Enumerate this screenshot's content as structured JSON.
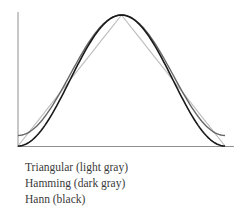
{
  "chart_data": {
    "type": "line",
    "title": "",
    "xlabel": "",
    "ylabel": "",
    "x_range": [
      0,
      1
    ],
    "y_range": [
      0,
      1
    ],
    "grid": false,
    "legend_position": "below",
    "x": [
      0,
      0.05,
      0.1,
      0.15,
      0.2,
      0.25,
      0.3,
      0.35,
      0.4,
      0.45,
      0.5,
      0.55,
      0.6,
      0.65,
      0.7,
      0.75,
      0.8,
      0.85,
      0.9,
      0.95,
      1.0
    ],
    "series": [
      {
        "name": "Triangular",
        "color": "#c0c0c0",
        "values": [
          0,
          0.1,
          0.2,
          0.3,
          0.4,
          0.5,
          0.6,
          0.7,
          0.8,
          0.9,
          1.0,
          0.9,
          0.8,
          0.7,
          0.6,
          0.5,
          0.4,
          0.3,
          0.2,
          0.1,
          0
        ]
      },
      {
        "name": "Hamming",
        "color": "#666666",
        "values": [
          0.08,
          0.102,
          0.168,
          0.27,
          0.398,
          0.54,
          0.682,
          0.81,
          0.912,
          0.978,
          1.0,
          0.978,
          0.912,
          0.81,
          0.682,
          0.54,
          0.398,
          0.27,
          0.168,
          0.102,
          0.08
        ]
      },
      {
        "name": "Hann",
        "color": "#1a1a1a",
        "values": [
          0,
          0.024,
          0.095,
          0.206,
          0.345,
          0.5,
          0.655,
          0.794,
          0.905,
          0.976,
          1.0,
          0.976,
          0.905,
          0.794,
          0.655,
          0.5,
          0.345,
          0.206,
          0.095,
          0.024,
          0
        ]
      }
    ]
  },
  "legend": {
    "items": [
      "Triangular (light gray)",
      "Hamming (dark gray)",
      "Hann (black)"
    ]
  },
  "colors": {
    "axis": "#909090",
    "triangular": "#c0c0c0",
    "hamming": "#666666",
    "hann": "#1a1a1a"
  }
}
